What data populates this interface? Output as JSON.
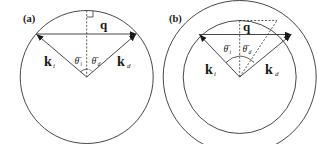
{
  "panels": [
    {
      "id": "a",
      "label": "(a)",
      "vector_q": "q",
      "vector_ki": "k",
      "vector_ki_sub": "i",
      "vector_kd": "k",
      "vector_kd_sub": "d",
      "angle_i": "θ̄",
      "angle_i_sub": "i",
      "angle_d": "θ̄",
      "angle_d_sub": "d"
    },
    {
      "id": "b",
      "label": "(b)",
      "vector_q": "q",
      "vector_ki": "k",
      "vector_ki_sub": "i",
      "vector_kd": "k",
      "vector_kd_sub": "d",
      "angle_i": "θ̄",
      "angle_i_sub": "i",
      "angle_d": "θ̄",
      "angle_d_sub": "d"
    }
  ],
  "colors": {
    "stroke": "#333333",
    "text": "#1a1a1a"
  }
}
